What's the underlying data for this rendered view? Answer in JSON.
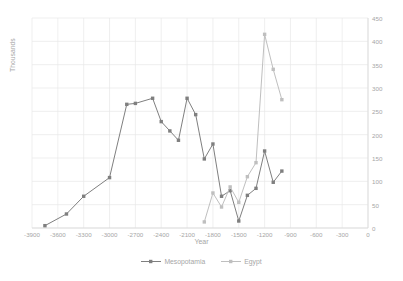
{
  "chart_data": {
    "type": "line",
    "title": "",
    "xlabel": "Year",
    "ylabel": "Thousands",
    "xlim": [
      -3900,
      0
    ],
    "ylim": [
      0,
      450
    ],
    "xticks": [
      "-3900",
      "-3600",
      "-3300",
      "-3000",
      "-2700",
      "-2400",
      "-2100",
      "-1800",
      "-1500",
      "-1200",
      "-900",
      "-600",
      "-300",
      "0"
    ],
    "xtick_values": [
      -3900,
      -3600,
      -3300,
      -3000,
      -2700,
      -2400,
      -2100,
      -1800,
      -1500,
      -1200,
      -900,
      -600,
      -300,
      0
    ],
    "yticks": [
      "0",
      "50",
      "100",
      "150",
      "200",
      "250",
      "300",
      "350",
      "400",
      "450"
    ],
    "ytick_values": [
      0,
      50,
      100,
      150,
      200,
      250,
      300,
      350,
      400,
      450
    ],
    "grid": true,
    "y_axis_position": "right",
    "legend_position": "bottom",
    "series": [
      {
        "name": "Mesopotamia",
        "color": "#7f7f7f",
        "marker": "square",
        "x": [
          -3750,
          -3500,
          -3300,
          -3000,
          -2800,
          -2700,
          -2500,
          -2400,
          -2300,
          -2200,
          -2100,
          -2000,
          -1900,
          -1800,
          -1700,
          -1600,
          -1500,
          -1400,
          -1300,
          -1200,
          -1100,
          -1000
        ],
        "values": [
          5,
          30,
          68,
          108,
          265,
          267,
          278,
          228,
          208,
          188,
          278,
          243,
          148,
          180,
          68,
          80,
          15,
          70,
          85,
          165,
          98,
          122
        ]
      },
      {
        "name": "Egypt",
        "color": "#bfbfbf",
        "marker": "square",
        "x": [
          -1900,
          -1800,
          -1700,
          -1600,
          -1500,
          -1400,
          -1300,
          -1200,
          -1100,
          -1000
        ],
        "values": [
          13,
          75,
          45,
          88,
          55,
          110,
          140,
          415,
          340,
          275
        ]
      }
    ]
  },
  "legend": {
    "items": [
      {
        "label": "Mesopotamia",
        "color": "#7f7f7f"
      },
      {
        "label": "Egypt",
        "color": "#bfbfbf"
      }
    ]
  },
  "axes": {
    "x_title": "Year",
    "y_title": "Thousands"
  },
  "colors": {
    "grid": "#e8e8e8",
    "text": "#a6a6a6",
    "mesopotamia": "#7f7f7f",
    "egypt": "#bfbfbf",
    "background": "#ffffff"
  }
}
